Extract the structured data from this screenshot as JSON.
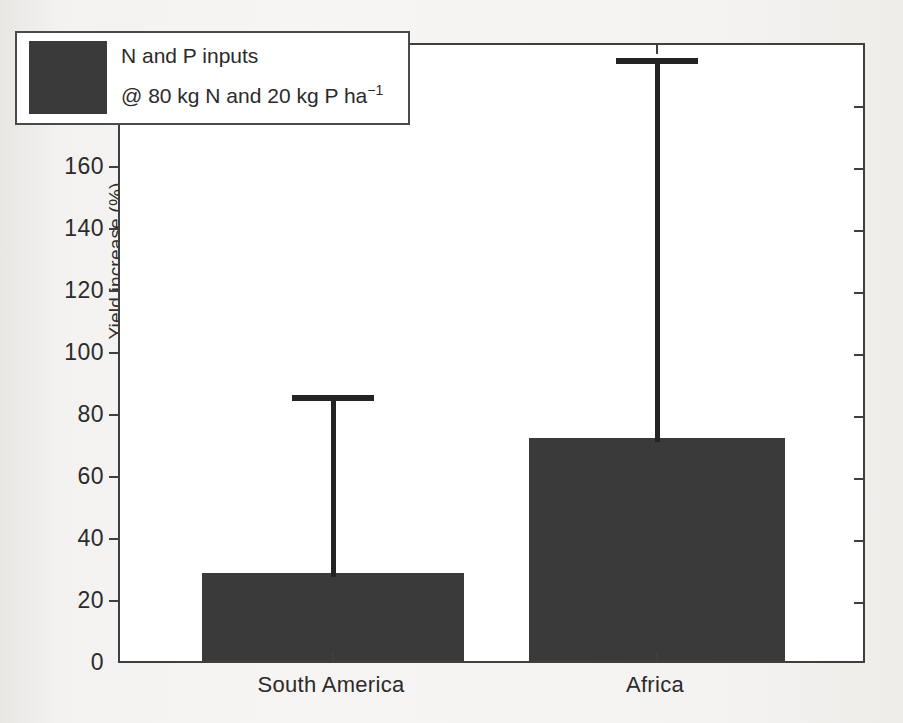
{
  "chart_data": {
    "type": "bar",
    "title": "",
    "xlabel": "",
    "ylabel": "Yield increase (%)",
    "categories": [
      "South America",
      "Africa"
    ],
    "values": [
      28.5,
      72
    ],
    "errors_upper": [
      86,
      195
    ],
    "ylim": [
      0,
      200
    ],
    "ytick_step": 20,
    "yticks": [
      "0",
      "20",
      "40",
      "60",
      "80",
      "100",
      "120",
      "140",
      "160",
      "180",
      "200"
    ],
    "grid": false,
    "legend_position": "upper-left",
    "series": [
      {
        "name": "N and P inputs @ 80 kg N and 20 kg P ha-1",
        "values": [
          28.5,
          72
        ],
        "errors_upper": [
          86,
          195
        ],
        "color": "#3a3a3a"
      }
    ],
    "annotations": []
  },
  "legend": {
    "line_1": "N and P inputs",
    "line_2_prefix": "@ 80 kg N and 20 kg P ha",
    "line_2_exponent": "−1",
    "swatch_color": "#3a3a3a"
  },
  "axes": {
    "y_label": "Yield increase (%)",
    "y_min": 0,
    "y_max": 200,
    "y_ticks": [
      "0",
      "20",
      "40",
      "60",
      "80",
      "100",
      "120",
      "140",
      "160",
      "180",
      "200"
    ],
    "x_categories": [
      "South America",
      "Africa"
    ]
  },
  "colors": {
    "bar": "#3a3a3a",
    "axis": "#3f3f3f",
    "error_bar": "#232323",
    "text": "#2b2b2b",
    "plot_background": "#ffffff",
    "page_background": "#f2f1ef"
  }
}
